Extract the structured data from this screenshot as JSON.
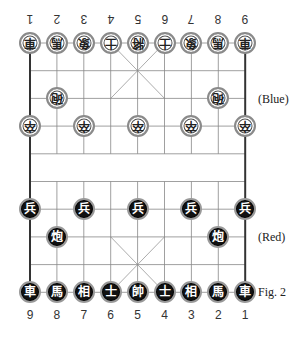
{
  "figure": {
    "caption": "Fig. 2",
    "top_side_label": "(Blue)",
    "bottom_side_label": "(Red)"
  },
  "board": {
    "files": 9,
    "ranks": 10,
    "colors": {
      "line": "#888888",
      "border": "#333333",
      "blue_piece_fill": "#ffffff",
      "red_piece_fill": "#111111"
    }
  },
  "file_labels": {
    "top": [
      "1",
      "2",
      "3",
      "4",
      "5",
      "6",
      "7",
      "8",
      "9"
    ],
    "bottom": [
      "9",
      "8",
      "7",
      "6",
      "5",
      "4",
      "3",
      "2",
      "1"
    ]
  },
  "pieces": {
    "blue": [
      {
        "name": "chariot",
        "glyph": "車",
        "file": 0,
        "rank": 0
      },
      {
        "name": "horse",
        "glyph": "馬",
        "file": 1,
        "rank": 0
      },
      {
        "name": "elephant",
        "glyph": "象",
        "file": 2,
        "rank": 0
      },
      {
        "name": "advisor",
        "glyph": "士",
        "file": 3,
        "rank": 0
      },
      {
        "name": "general",
        "glyph": "將",
        "file": 4,
        "rank": 0
      },
      {
        "name": "advisor",
        "glyph": "士",
        "file": 5,
        "rank": 0
      },
      {
        "name": "elephant",
        "glyph": "象",
        "file": 6,
        "rank": 0
      },
      {
        "name": "horse",
        "glyph": "馬",
        "file": 7,
        "rank": 0
      },
      {
        "name": "chariot",
        "glyph": "車",
        "file": 8,
        "rank": 0
      },
      {
        "name": "cannon",
        "glyph": "砲",
        "file": 1,
        "rank": 2
      },
      {
        "name": "cannon",
        "glyph": "砲",
        "file": 7,
        "rank": 2
      },
      {
        "name": "soldier",
        "glyph": "卒",
        "file": 0,
        "rank": 3
      },
      {
        "name": "soldier",
        "glyph": "卒",
        "file": 2,
        "rank": 3
      },
      {
        "name": "soldier",
        "glyph": "卒",
        "file": 4,
        "rank": 3
      },
      {
        "name": "soldier",
        "glyph": "卒",
        "file": 6,
        "rank": 3
      },
      {
        "name": "soldier",
        "glyph": "卒",
        "file": 8,
        "rank": 3
      }
    ],
    "red": [
      {
        "name": "soldier",
        "glyph": "兵",
        "file": 0,
        "rank": 6
      },
      {
        "name": "soldier",
        "glyph": "兵",
        "file": 2,
        "rank": 6
      },
      {
        "name": "soldier",
        "glyph": "兵",
        "file": 4,
        "rank": 6
      },
      {
        "name": "soldier",
        "glyph": "兵",
        "file": 6,
        "rank": 6
      },
      {
        "name": "soldier",
        "glyph": "兵",
        "file": 8,
        "rank": 6
      },
      {
        "name": "cannon",
        "glyph": "炮",
        "file": 1,
        "rank": 7
      },
      {
        "name": "cannon",
        "glyph": "炮",
        "file": 7,
        "rank": 7
      },
      {
        "name": "chariot",
        "glyph": "車",
        "file": 0,
        "rank": 9
      },
      {
        "name": "horse",
        "glyph": "馬",
        "file": 1,
        "rank": 9
      },
      {
        "name": "elephant",
        "glyph": "相",
        "file": 2,
        "rank": 9
      },
      {
        "name": "advisor",
        "glyph": "士",
        "file": 3,
        "rank": 9
      },
      {
        "name": "general",
        "glyph": "帥",
        "file": 4,
        "rank": 9
      },
      {
        "name": "advisor",
        "glyph": "士",
        "file": 5,
        "rank": 9
      },
      {
        "name": "elephant",
        "glyph": "相",
        "file": 6,
        "rank": 9
      },
      {
        "name": "horse",
        "glyph": "馬",
        "file": 7,
        "rank": 9
      },
      {
        "name": "chariot",
        "glyph": "車",
        "file": 8,
        "rank": 9
      }
    ]
  }
}
